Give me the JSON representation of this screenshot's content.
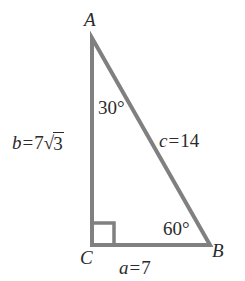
{
  "figure": {
    "kind": "right-triangle",
    "background_color": "#ffffff",
    "stroke_color": "#808080",
    "stroke_width": 4,
    "text_color": "#2b2b2b",
    "vertices": {
      "A": {
        "label": "A",
        "x": 92,
        "y": 38
      },
      "C": {
        "label": "C",
        "x": 92,
        "y": 245
      },
      "B": {
        "label": "B",
        "x": 210,
        "y": 245
      }
    },
    "right_angle_marker": {
      "at_vertex": "C",
      "size": 20
    }
  },
  "labels": {
    "vertex_a": "A",
    "vertex_b": "B",
    "vertex_c": "C",
    "angle_at_a": "30°",
    "angle_at_b": "60°",
    "angle_at_c": "90°",
    "side_b": {
      "var": "b",
      "eq": "=",
      "coefficient": "7",
      "radical_sign": "√",
      "radicand": "3",
      "full_text": "b = 7√3"
    },
    "side_c": {
      "var": "c",
      "eq": "=",
      "value": "14",
      "full_text": "c = 14"
    },
    "side_a": {
      "var": "a",
      "eq": "=",
      "value": "7",
      "full_text": "a = 7"
    }
  }
}
